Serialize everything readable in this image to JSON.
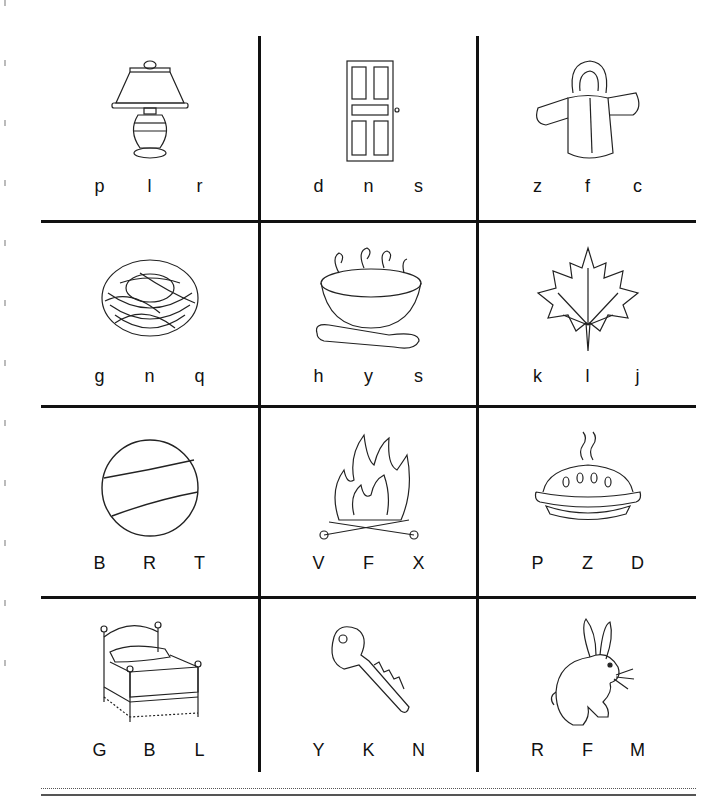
{
  "worksheet": {
    "rows": [
      [
        {
          "picture": "lamp-icon",
          "letters": [
            "p",
            "l",
            "r"
          ]
        },
        {
          "picture": "door-icon",
          "letters": [
            "d",
            "n",
            "s"
          ]
        },
        {
          "picture": "jacket-icon",
          "letters": [
            "z",
            "f",
            "c"
          ]
        }
      ],
      [
        {
          "picture": "nest-icon",
          "letters": [
            "g",
            "n",
            "q"
          ]
        },
        {
          "picture": "soup-icon",
          "letters": [
            "h",
            "y",
            "s"
          ]
        },
        {
          "picture": "leaf-icon",
          "letters": [
            "k",
            "l",
            "j"
          ]
        }
      ],
      [
        {
          "picture": "ball-icon",
          "letters": [
            "B",
            "R",
            "T"
          ]
        },
        {
          "picture": "fire-icon",
          "letters": [
            "V",
            "F",
            "X"
          ]
        },
        {
          "picture": "pie-icon",
          "letters": [
            "P",
            "Z",
            "D"
          ]
        }
      ],
      [
        {
          "picture": "bed-icon",
          "letters": [
            "G",
            "B",
            "L"
          ]
        },
        {
          "picture": "key-icon",
          "letters": [
            "Y",
            "K",
            "N"
          ]
        },
        {
          "picture": "rabbit-icon",
          "letters": [
            "R",
            "F",
            "M"
          ]
        }
      ]
    ]
  },
  "colors": {
    "line": "#111111",
    "background": "#ffffff"
  }
}
